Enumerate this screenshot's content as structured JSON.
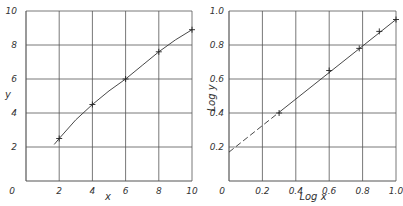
{
  "chart_data": [
    {
      "type": "line",
      "title": "",
      "xlabel": "x",
      "ylabel": "y",
      "xlim": [
        0,
        10
      ],
      "ylim": [
        0,
        10
      ],
      "grid": true,
      "xticks": [
        "0",
        "2",
        "4",
        "6",
        "8",
        "10"
      ],
      "yticks": [
        "0",
        "2",
        "4",
        "6",
        "8",
        "10"
      ],
      "series": [
        {
          "name": "measured",
          "marker": "+",
          "x": [
            2,
            4,
            6,
            8,
            10
          ],
          "y": [
            2.5,
            4.5,
            6.0,
            7.6,
            8.9
          ]
        }
      ],
      "curve": {
        "x": [
          1.7,
          2,
          3,
          4,
          5,
          6,
          7,
          8,
          9,
          10
        ],
        "y": [
          2.15,
          2.5,
          3.6,
          4.5,
          5.3,
          6.0,
          6.8,
          7.6,
          8.3,
          8.9
        ]
      }
    },
    {
      "type": "line",
      "title": "",
      "xlabel": "Log x",
      "ylabel": "Log y",
      "xlim": [
        0,
        1.0
      ],
      "ylim": [
        0,
        1.0
      ],
      "grid": true,
      "xticks": [
        "0",
        "0.2",
        "0.4",
        "0.6",
        "0.8",
        "1.0"
      ],
      "yticks": [
        "0.2",
        "0.4",
        "0.6",
        "0.8",
        "1.0"
      ],
      "series": [
        {
          "name": "log data",
          "marker": "+",
          "x": [
            0.3,
            0.6,
            0.78,
            0.9,
            1.0
          ],
          "y": [
            0.4,
            0.65,
            0.78,
            0.88,
            0.95
          ]
        }
      ],
      "fit_line": {
        "x": [
          0,
          1.0
        ],
        "y": [
          0.17,
          0.95
        ],
        "extrapolated_dashed_below_x": 0.3
      }
    }
  ]
}
